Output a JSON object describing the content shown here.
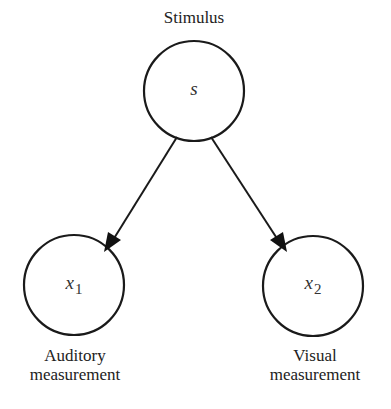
{
  "diagram": {
    "type": "graphical-model",
    "nodes": [
      {
        "id": "s",
        "symbol": "s",
        "subscript": "",
        "label_lines": [
          "Stimulus"
        ]
      },
      {
        "id": "x1",
        "symbol": "x",
        "subscript": "1",
        "label_lines": [
          "Auditory",
          "measurement"
        ]
      },
      {
        "id": "x2",
        "symbol": "x",
        "subscript": "2",
        "label_lines": [
          "Visual",
          "measurement"
        ]
      }
    ],
    "edges": [
      {
        "from": "s",
        "to": "x1"
      },
      {
        "from": "s",
        "to": "x2"
      }
    ],
    "colors": {
      "stroke": "#1a1a1a",
      "text": "#222222",
      "background": "#ffffff"
    }
  }
}
